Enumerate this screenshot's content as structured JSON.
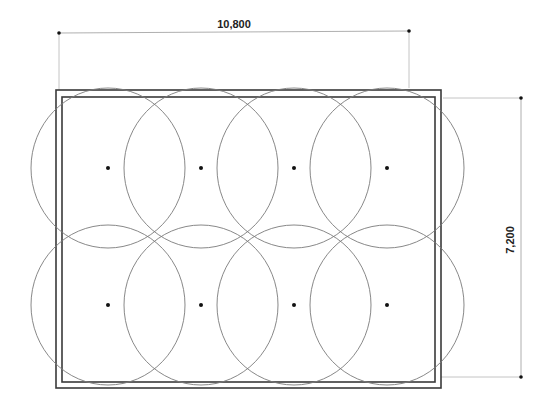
{
  "diagram": {
    "type": "floor-plan-coverage",
    "dimensions": {
      "width_label": "10,800",
      "height_label": "7,200"
    },
    "room": {
      "outer": {
        "x": 56,
        "y": 90,
        "w": 385,
        "h": 298
      },
      "inner": {
        "x": 62,
        "y": 97,
        "w": 373,
        "h": 285
      }
    },
    "coverage_circles": {
      "rx": 77,
      "ry": 80,
      "rows": [
        168,
        305
      ],
      "cols": [
        108,
        201,
        294,
        387
      ]
    },
    "colors": {
      "wall": "#3a3a3a",
      "circle": "#7a7a7a",
      "dimension_line": "#b0b0b0",
      "dot": "#111111"
    }
  }
}
